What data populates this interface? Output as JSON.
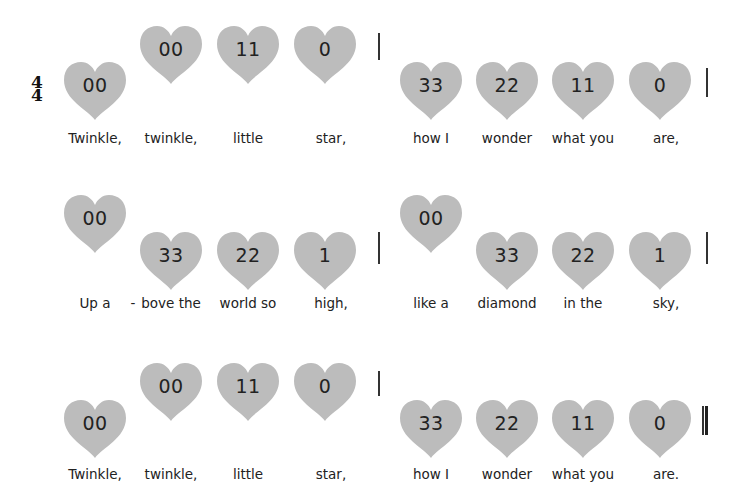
{
  "colors": {
    "heart": "#bcbcbc",
    "text": "#222222"
  },
  "time_signature": {
    "top": "4",
    "bottom": "4"
  },
  "systems": [
    {
      "measures": [
        {
          "notes": [
            {
              "num": "00",
              "level": "low",
              "lyric": "Twinkle,"
            },
            {
              "num": "00",
              "level": "high",
              "lyric": "twinkle,"
            },
            {
              "num": "11",
              "level": "high",
              "lyric": "little"
            },
            {
              "num": "0",
              "level": "high",
              "lyric": "star,"
            }
          ],
          "barline": "single"
        },
        {
          "notes": [
            {
              "num": "33",
              "level": "low",
              "lyric": "how I"
            },
            {
              "num": "22",
              "level": "low",
              "lyric": "wonder"
            },
            {
              "num": "11",
              "level": "low",
              "lyric": "what you"
            },
            {
              "num": "0",
              "level": "low",
              "lyric": "are,"
            }
          ],
          "barline": "single"
        }
      ]
    },
    {
      "measures": [
        {
          "notes": [
            {
              "num": "00",
              "level": "high",
              "lyric": "Up a"
            },
            {
              "num": "33",
              "level": "low",
              "lyric": "bove the"
            },
            {
              "num": "22",
              "level": "low",
              "lyric": "world so"
            },
            {
              "num": "1",
              "level": "low",
              "lyric": "high,"
            }
          ],
          "hyphen": "-",
          "barline": "single"
        },
        {
          "notes": [
            {
              "num": "00",
              "level": "high",
              "lyric": "like a"
            },
            {
              "num": "33",
              "level": "low",
              "lyric": "diamond"
            },
            {
              "num": "22",
              "level": "low",
              "lyric": "in the"
            },
            {
              "num": "1",
              "level": "low",
              "lyric": "sky,"
            }
          ],
          "barline": "single"
        }
      ]
    },
    {
      "measures": [
        {
          "notes": [
            {
              "num": "00",
              "level": "low",
              "lyric": "Twinkle,"
            },
            {
              "num": "00",
              "level": "high",
              "lyric": "twinkle,"
            },
            {
              "num": "11",
              "level": "high",
              "lyric": "little"
            },
            {
              "num": "0",
              "level": "high",
              "lyric": "star,"
            }
          ],
          "barline": "single"
        },
        {
          "notes": [
            {
              "num": "33",
              "level": "low",
              "lyric": "how I"
            },
            {
              "num": "22",
              "level": "low",
              "lyric": "wonder"
            },
            {
              "num": "11",
              "level": "low",
              "lyric": "what you"
            },
            {
              "num": "0",
              "level": "low",
              "lyric": "are."
            }
          ],
          "barline": "final"
        }
      ]
    }
  ]
}
